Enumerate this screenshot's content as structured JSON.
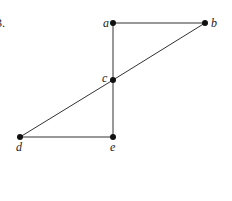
{
  "problem_number": "3.",
  "graph": {
    "nodes": [
      {
        "id": "a",
        "label": "a",
        "x": 113,
        "y": 23,
        "lx": 103,
        "ly": 27
      },
      {
        "id": "b",
        "label": "b",
        "x": 205,
        "y": 23,
        "lx": 211,
        "ly": 27
      },
      {
        "id": "c",
        "label": "c",
        "x": 113,
        "y": 80,
        "lx": 102,
        "ly": 82
      },
      {
        "id": "d",
        "label": "d",
        "x": 20,
        "y": 137,
        "lx": 16,
        "ly": 151
      },
      {
        "id": "e",
        "label": "e",
        "x": 113,
        "y": 137,
        "lx": 110,
        "ly": 151
      }
    ],
    "edges": [
      [
        "a",
        "b"
      ],
      [
        "a",
        "c"
      ],
      [
        "b",
        "c"
      ],
      [
        "c",
        "d"
      ],
      [
        "c",
        "e"
      ],
      [
        "d",
        "e"
      ]
    ]
  }
}
